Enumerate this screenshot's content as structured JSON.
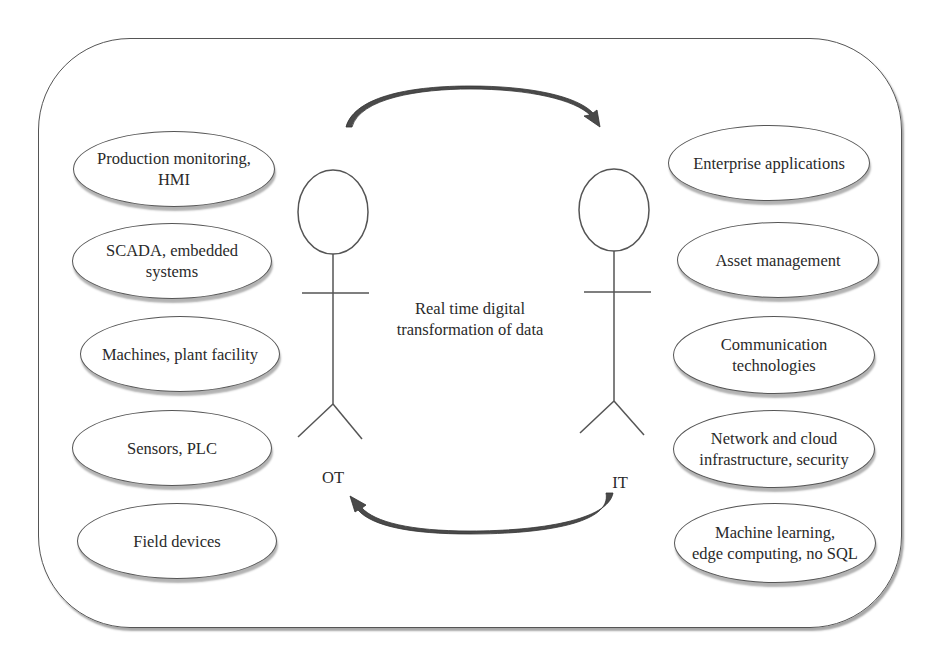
{
  "diagram": {
    "center_text": "Real time digital\ntransformation of data",
    "actors": {
      "ot": {
        "label": "OT"
      },
      "it": {
        "label": "IT"
      }
    },
    "ot_items": [
      {
        "label": "Production monitoring,\nHMI"
      },
      {
        "label": "SCADA, embedded\nsystems"
      },
      {
        "label": "Machines, plant facility"
      },
      {
        "label": "Sensors, PLC"
      },
      {
        "label": "Field devices"
      }
    ],
    "it_items": [
      {
        "label": "Enterprise applications"
      },
      {
        "label": "Asset management"
      },
      {
        "label": "Communication\ntechnologies"
      },
      {
        "label": "Network and cloud\ninfrastructure, security"
      },
      {
        "label": "Machine learning,\nedge computing, no SQL"
      }
    ],
    "arrows": [
      {
        "from": "OT",
        "to": "IT",
        "position": "top"
      },
      {
        "from": "IT",
        "to": "OT",
        "position": "bottom"
      }
    ],
    "colors": {
      "stroke": "#555555",
      "arrow_fill": "#4a4a4a",
      "text": "#2a2a2a",
      "background": "#ffffff"
    }
  }
}
